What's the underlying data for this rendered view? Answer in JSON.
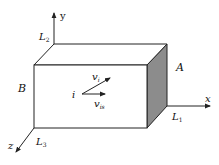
{
  "diagram": {
    "type": "3d-box-with-axes",
    "axes": {
      "x": "x",
      "y": "y",
      "z": "z"
    },
    "dimension_labels": {
      "L1": {
        "base": "L",
        "sub": "1"
      },
      "L2": {
        "base": "L",
        "sub": "2"
      },
      "L3": {
        "base": "L",
        "sub": "3"
      }
    },
    "face_labels": {
      "A": "A",
      "B": "B"
    },
    "particle": {
      "label": "i"
    },
    "vectors": {
      "vi": {
        "base": "v",
        "sub": "i"
      },
      "vis": {
        "base": "v",
        "sub": "is"
      }
    },
    "colors": {
      "stroke": "#222222",
      "shaded_face": "#8c8c8c",
      "background": "#ffffff"
    }
  }
}
